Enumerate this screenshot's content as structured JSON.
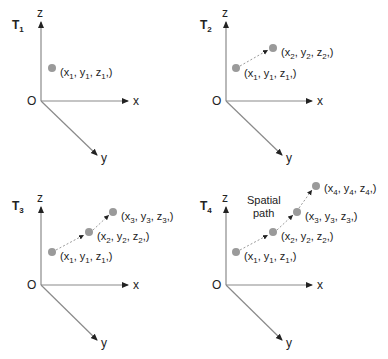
{
  "figure": {
    "panels": [
      {
        "title": "T",
        "title_sub": "1",
        "axes": {
          "z": "z",
          "x": "x",
          "y": "y",
          "origin": "O"
        },
        "points": [
          {
            "label": [
              "x",
              "1",
              "y",
              "1",
              "z",
              "1"
            ]
          }
        ]
      },
      {
        "title": "T",
        "title_sub": "2",
        "axes": {
          "z": "z",
          "x": "x",
          "y": "y",
          "origin": "O"
        },
        "points": [
          {
            "label": [
              "x",
              "1",
              "y",
              "1",
              "z",
              "1"
            ]
          },
          {
            "label": [
              "x",
              "2",
              "y",
              "2",
              "z",
              "2"
            ]
          }
        ]
      },
      {
        "title": "T",
        "title_sub": "3",
        "axes": {
          "z": "z",
          "x": "x",
          "y": "y",
          "origin": "O"
        },
        "points": [
          {
            "label": [
              "x",
              "1",
              "y",
              "1",
              "z",
              "1"
            ]
          },
          {
            "label": [
              "x",
              "2",
              "y",
              "2",
              "z",
              "2"
            ]
          },
          {
            "label": [
              "x",
              "3",
              "y",
              "3",
              "z",
              "3"
            ]
          }
        ]
      },
      {
        "title": "T",
        "title_sub": "4",
        "axes": {
          "z": "z",
          "x": "x",
          "y": "y",
          "origin": "O"
        },
        "annotation": [
          "Spatial",
          "path"
        ],
        "points": [
          {
            "label": [
              "x",
              "1",
              "y",
              "1",
              "z",
              "1"
            ]
          },
          {
            "label": [
              "x",
              "2",
              "y",
              "2",
              "z",
              "2"
            ]
          },
          {
            "label": [
              "x",
              "3",
              "y",
              "3",
              "z",
              "3"
            ]
          },
          {
            "label": [
              "x",
              "4",
              "y",
              "4",
              "z",
              "4"
            ]
          }
        ]
      }
    ],
    "colors": {
      "axis": "#8a8a8a",
      "point": "#9a9a9a",
      "path": "#9a9a9a",
      "text": "#222222"
    }
  }
}
